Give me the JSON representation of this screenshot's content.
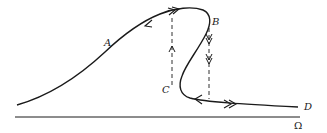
{
  "diagram": {
    "type": "hysteresis-jump-response-curve",
    "labels": {
      "A": "A",
      "B": "B",
      "C": "C",
      "D": "D",
      "axis": "Ω"
    },
    "colors": {
      "ink": "#1a1a1a",
      "background": "#ffffff"
    },
    "elements": {
      "curve": "S-shaped response curve from lower-left rising through A to a peak, bending back at B, down to C, then flattening out to D",
      "jump_up": "dashed vertical line from C up to upper branch with single upward arrow",
      "jump_down": "dashed vertical line from B down to lower branch with double downward arrows",
      "arrows_upper_branch": [
        "single arrow pointing back-left on rising branch",
        "double arrow pointing right near peak"
      ],
      "arrows_lower_branch": [
        "single arrow pointing left",
        "double arrow pointing right"
      ],
      "axis": "horizontal frequency axis labeled Ω"
    }
  }
}
